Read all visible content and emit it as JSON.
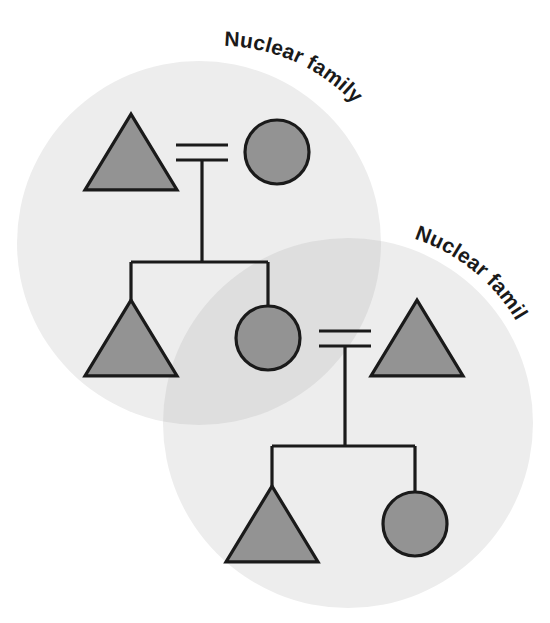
{
  "diagram": {
    "background_color": "#ffffff",
    "line_color": "#1a1a1a",
    "symbol_fill": "#939393",
    "symbol_stroke": "#1a1a1a",
    "group_fill": "#ededed",
    "group_overlap_fill": "#dedede"
  },
  "labels": {
    "family_one": "Nuclear family",
    "family_two": "Nuclear family"
  },
  "groups": [
    {
      "id": "group-nuclear-family-1",
      "label": "Nuclear family",
      "cx": 199,
      "cy": 243,
      "r": 182,
      "fill": "#ededed"
    },
    {
      "id": "group-nuclear-family-2",
      "label": "Nuclear family",
      "cx": 348,
      "cy": 423,
      "r": 185,
      "fill": "#ededed"
    }
  ],
  "symbols": [
    {
      "id": "male-gen1-father",
      "type": "triangle",
      "sex": "male",
      "cx": 131,
      "cy": 152,
      "size": 46,
      "generation": 1
    },
    {
      "id": "female-gen1-mother",
      "type": "circle",
      "sex": "female",
      "cx": 277,
      "cy": 152,
      "size": 32,
      "generation": 1
    },
    {
      "id": "male-gen2-son",
      "type": "triangle",
      "sex": "male",
      "cx": 131,
      "cy": 338,
      "size": 46,
      "generation": 2
    },
    {
      "id": "female-gen2-daughter",
      "type": "circle",
      "sex": "female",
      "cx": 268,
      "cy": 338,
      "size": 32,
      "generation": 2
    },
    {
      "id": "male-gen2-husband",
      "type": "triangle",
      "sex": "male",
      "cx": 417,
      "cy": 338,
      "size": 46,
      "generation": 2
    },
    {
      "id": "male-gen3-son",
      "type": "triangle",
      "sex": "male",
      "cx": 272,
      "cy": 524,
      "size": 46,
      "generation": 3
    },
    {
      "id": "female-gen3-daughter",
      "type": "circle",
      "sex": "female",
      "cx": 415,
      "cy": 524,
      "size": 32,
      "generation": 3
    }
  ],
  "unions": [
    {
      "id": "union-gen1",
      "bar_x1": 176,
      "bar_x2": 228,
      "bar_y_top": 145,
      "bar_y_bottom": 160,
      "descent_x": 202,
      "descent_y_end": 262,
      "sibling_bar_y": 262,
      "sibling_bar_x1": 131,
      "sibling_bar_x2": 268,
      "children": [
        "male-gen2-son",
        "female-gen2-daughter"
      ]
    },
    {
      "id": "union-gen2",
      "bar_x1": 319,
      "bar_x2": 371,
      "bar_y_top": 331,
      "bar_y_bottom": 346,
      "descent_x": 345,
      "descent_y_end": 446,
      "sibling_bar_y": 446,
      "sibling_bar_x1": 272,
      "sibling_bar_x2": 415,
      "children": [
        "male-gen3-son",
        "female-gen3-daughter"
      ]
    }
  ]
}
